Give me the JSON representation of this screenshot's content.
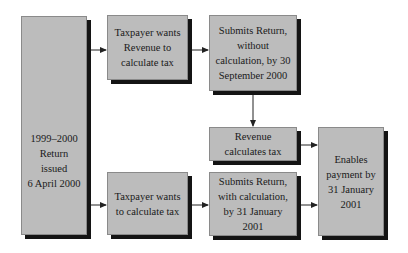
{
  "diagram": {
    "nodes": [
      {
        "id": "return-issued",
        "lines": [
          "1999–2000",
          "Return",
          "issued",
          "6 April 2000"
        ]
      },
      {
        "id": "wants-revenue-calc",
        "lines": [
          "Taxpayer wants",
          "Revenue to",
          "calculate tax"
        ]
      },
      {
        "id": "submits-without-calc",
        "lines": [
          "Submits Return,",
          "without",
          "calculation, by 30",
          "September 2000"
        ]
      },
      {
        "id": "revenue-calculates",
        "lines": [
          "Revenue",
          "calculates tax"
        ]
      },
      {
        "id": "wants-self-calc",
        "lines": [
          "Taxpayer wants",
          "to calculate tax"
        ]
      },
      {
        "id": "submits-with-calc",
        "lines": [
          "Submits Return,",
          "with calculation,",
          "by 31 January",
          "2001"
        ]
      },
      {
        "id": "enables-payment",
        "lines": [
          "Enables",
          "payment by",
          "31 January",
          "2001"
        ]
      }
    ],
    "edges": [
      {
        "from": "return-issued",
        "to": "wants-revenue-calc"
      },
      {
        "from": "return-issued",
        "to": "wants-self-calc"
      },
      {
        "from": "wants-revenue-calc",
        "to": "submits-without-calc"
      },
      {
        "from": "submits-without-calc",
        "to": "revenue-calculates"
      },
      {
        "from": "revenue-calculates",
        "to": "enables-payment"
      },
      {
        "from": "wants-self-calc",
        "to": "submits-with-calc"
      },
      {
        "from": "submits-with-calc",
        "to": "enables-payment"
      }
    ],
    "colors": {
      "box_fill": "#bcbcbc",
      "shadow": "#141414",
      "arrow": "#222222"
    }
  }
}
